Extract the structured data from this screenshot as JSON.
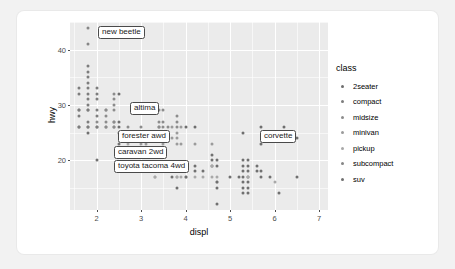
{
  "chart_data": {
    "type": "scatter",
    "title": "",
    "xlabel": "displ",
    "ylabel": "hwy",
    "xlim": [
      1.4,
      7.2
    ],
    "ylim": [
      11,
      45
    ],
    "xticks": [
      2,
      3,
      4,
      5,
      6,
      7
    ],
    "yticks": [
      20,
      30,
      40
    ],
    "grid": true,
    "legend": {
      "title": "class",
      "position": "right",
      "entries": [
        {
          "label": "2seater",
          "color": "#6e6e6e"
        },
        {
          "label": "compact",
          "color": "#7d7d7d"
        },
        {
          "label": "midsize",
          "color": "#8c8c8c"
        },
        {
          "label": "minivan",
          "color": "#9b9b9b"
        },
        {
          "label": "pickup",
          "color": "#a8a8a8"
        },
        {
          "label": "subcompact",
          "color": "#868686"
        },
        {
          "label": "suv",
          "color": "#707070"
        }
      ]
    },
    "annotations": [
      {
        "text": "new beetle",
        "x": 2.0,
        "y": 44,
        "box_x": 28,
        "box_y": 4
      },
      {
        "text": "altima",
        "x": 2.5,
        "y": 32,
        "box_x": 60,
        "box_y": 80
      },
      {
        "text": "forester awd",
        "x": 2.5,
        "y": 27,
        "box_x": 48,
        "box_y": 108
      },
      {
        "text": "caravan 2wd",
        "x": 3.3,
        "y": 24,
        "box_x": 44,
        "box_y": 124
      },
      {
        "text": "toyota tacoma 4wd",
        "x": 2.7,
        "y": 22,
        "box_x": 44,
        "box_y": 138
      },
      {
        "text": "corvette",
        "x": 5.7,
        "y": 26,
        "box_x": 190,
        "box_y": 108
      }
    ],
    "points": [
      {
        "x": 1.6,
        "y": 33,
        "c": 1
      },
      {
        "x": 1.6,
        "y": 32,
        "c": 1
      },
      {
        "x": 1.6,
        "y": 29,
        "c": 1
      },
      {
        "x": 1.6,
        "y": 29,
        "c": 1
      },
      {
        "x": 1.6,
        "y": 28,
        "c": 1
      },
      {
        "x": 1.6,
        "y": 26,
        "c": 1
      },
      {
        "x": 1.6,
        "y": 26,
        "c": 1
      },
      {
        "x": 1.8,
        "y": 44,
        "c": 5
      },
      {
        "x": 1.8,
        "y": 41,
        "c": 5
      },
      {
        "x": 1.8,
        "y": 37,
        "c": 1
      },
      {
        "x": 1.8,
        "y": 36,
        "c": 1
      },
      {
        "x": 1.8,
        "y": 35,
        "c": 1
      },
      {
        "x": 1.8,
        "y": 34,
        "c": 1
      },
      {
        "x": 1.8,
        "y": 33,
        "c": 1
      },
      {
        "x": 1.8,
        "y": 32,
        "c": 1
      },
      {
        "x": 1.8,
        "y": 31,
        "c": 1
      },
      {
        "x": 1.8,
        "y": 30,
        "c": 1
      },
      {
        "x": 1.8,
        "y": 29,
        "c": 1
      },
      {
        "x": 1.8,
        "y": 29,
        "c": 1
      },
      {
        "x": 1.8,
        "y": 27,
        "c": 1
      },
      {
        "x": 1.8,
        "y": 26,
        "c": 1
      },
      {
        "x": 1.8,
        "y": 26,
        "c": 1
      },
      {
        "x": 1.8,
        "y": 25,
        "c": 6
      },
      {
        "x": 2.0,
        "y": 33,
        "c": 1
      },
      {
        "x": 2.0,
        "y": 32,
        "c": 1
      },
      {
        "x": 2.0,
        "y": 31,
        "c": 1
      },
      {
        "x": 2.0,
        "y": 29,
        "c": 1
      },
      {
        "x": 2.0,
        "y": 28,
        "c": 1
      },
      {
        "x": 2.0,
        "y": 27,
        "c": 2
      },
      {
        "x": 2.0,
        "y": 26,
        "c": 1
      },
      {
        "x": 2.0,
        "y": 26,
        "c": 1
      },
      {
        "x": 2.0,
        "y": 20,
        "c": 6
      },
      {
        "x": 2.2,
        "y": 29,
        "c": 2
      },
      {
        "x": 2.2,
        "y": 29,
        "c": 2
      },
      {
        "x": 2.2,
        "y": 28,
        "c": 2
      },
      {
        "x": 2.2,
        "y": 27,
        "c": 2
      },
      {
        "x": 2.2,
        "y": 26,
        "c": 2
      },
      {
        "x": 2.2,
        "y": 26,
        "c": 2
      },
      {
        "x": 2.4,
        "y": 32,
        "c": 2
      },
      {
        "x": 2.4,
        "y": 31,
        "c": 2
      },
      {
        "x": 2.4,
        "y": 30,
        "c": 2
      },
      {
        "x": 2.4,
        "y": 29,
        "c": 2
      },
      {
        "x": 2.4,
        "y": 27,
        "c": 2
      },
      {
        "x": 2.4,
        "y": 27,
        "c": 2
      },
      {
        "x": 2.4,
        "y": 26,
        "c": 2
      },
      {
        "x": 2.4,
        "y": 26,
        "c": 2
      },
      {
        "x": 2.5,
        "y": 32,
        "c": 6
      },
      {
        "x": 2.5,
        "y": 27,
        "c": 6
      },
      {
        "x": 2.5,
        "y": 26,
        "c": 6
      },
      {
        "x": 2.5,
        "y": 25,
        "c": 6
      },
      {
        "x": 2.5,
        "y": 23,
        "c": 6
      },
      {
        "x": 2.5,
        "y": 22,
        "c": 6
      },
      {
        "x": 2.7,
        "y": 26,
        "c": 2
      },
      {
        "x": 2.7,
        "y": 25,
        "c": 2
      },
      {
        "x": 2.7,
        "y": 24,
        "c": 2
      },
      {
        "x": 2.7,
        "y": 23,
        "c": 4
      },
      {
        "x": 2.7,
        "y": 22,
        "c": 4
      },
      {
        "x": 2.7,
        "y": 22,
        "c": 4
      },
      {
        "x": 2.8,
        "y": 24,
        "c": 3
      },
      {
        "x": 2.8,
        "y": 24,
        "c": 3
      },
      {
        "x": 3.0,
        "y": 26,
        "c": 2
      },
      {
        "x": 3.0,
        "y": 25,
        "c": 2
      },
      {
        "x": 3.0,
        "y": 24,
        "c": 3
      },
      {
        "x": 3.0,
        "y": 23,
        "c": 3
      },
      {
        "x": 3.1,
        "y": 23,
        "c": 3
      },
      {
        "x": 3.1,
        "y": 22,
        "c": 3
      },
      {
        "x": 3.3,
        "y": 22,
        "c": 3
      },
      {
        "x": 3.3,
        "y": 18,
        "c": 4
      },
      {
        "x": 3.3,
        "y": 17,
        "c": 4
      },
      {
        "x": 3.3,
        "y": 17,
        "c": 4
      },
      {
        "x": 3.4,
        "y": 29,
        "c": 2
      },
      {
        "x": 3.4,
        "y": 27,
        "c": 2
      },
      {
        "x": 3.4,
        "y": 26,
        "c": 2
      },
      {
        "x": 3.4,
        "y": 26,
        "c": 2
      },
      {
        "x": 3.4,
        "y": 24,
        "c": 3
      },
      {
        "x": 3.4,
        "y": 22,
        "c": 6
      },
      {
        "x": 3.5,
        "y": 29,
        "c": 2
      },
      {
        "x": 3.5,
        "y": 27,
        "c": 2
      },
      {
        "x": 3.5,
        "y": 26,
        "c": 2
      },
      {
        "x": 3.5,
        "y": 25,
        "c": 3
      },
      {
        "x": 3.5,
        "y": 23,
        "c": 3
      },
      {
        "x": 3.5,
        "y": 19,
        "c": 6
      },
      {
        "x": 3.5,
        "y": 18,
        "c": 6
      },
      {
        "x": 3.5,
        "y": 18,
        "c": 6
      },
      {
        "x": 3.6,
        "y": 26,
        "c": 2
      },
      {
        "x": 3.6,
        "y": 24,
        "c": 3
      },
      {
        "x": 3.6,
        "y": 19,
        "c": 6
      },
      {
        "x": 3.6,
        "y": 18,
        "c": 6
      },
      {
        "x": 3.7,
        "y": 26,
        "c": 3
      },
      {
        "x": 3.7,
        "y": 24,
        "c": 3
      },
      {
        "x": 3.7,
        "y": 18,
        "c": 6
      },
      {
        "x": 3.7,
        "y": 17,
        "c": 6
      },
      {
        "x": 3.8,
        "y": 28,
        "c": 2
      },
      {
        "x": 3.8,
        "y": 27,
        "c": 2
      },
      {
        "x": 3.8,
        "y": 26,
        "c": 2
      },
      {
        "x": 3.8,
        "y": 25,
        "c": 3
      },
      {
        "x": 3.8,
        "y": 24,
        "c": 3
      },
      {
        "x": 3.8,
        "y": 23,
        "c": 3
      },
      {
        "x": 3.8,
        "y": 19,
        "c": 6
      },
      {
        "x": 3.8,
        "y": 18,
        "c": 6
      },
      {
        "x": 3.8,
        "y": 17,
        "c": 4
      },
      {
        "x": 3.8,
        "y": 17,
        "c": 4
      },
      {
        "x": 3.8,
        "y": 15,
        "c": 6
      },
      {
        "x": 3.9,
        "y": 26,
        "c": 3
      },
      {
        "x": 3.9,
        "y": 23,
        "c": 3
      },
      {
        "x": 3.9,
        "y": 19,
        "c": 6
      },
      {
        "x": 3.9,
        "y": 17,
        "c": 4
      },
      {
        "x": 4.0,
        "y": 26,
        "c": 0
      },
      {
        "x": 4.0,
        "y": 19,
        "c": 6
      },
      {
        "x": 4.0,
        "y": 17,
        "c": 4
      },
      {
        "x": 4.0,
        "y": 17,
        "c": 6
      },
      {
        "x": 4.2,
        "y": 26,
        "c": 0
      },
      {
        "x": 4.2,
        "y": 23,
        "c": 3
      },
      {
        "x": 4.2,
        "y": 19,
        "c": 6
      },
      {
        "x": 4.2,
        "y": 18,
        "c": 6
      },
      {
        "x": 4.2,
        "y": 17,
        "c": 4
      },
      {
        "x": 4.4,
        "y": 18,
        "c": 6
      },
      {
        "x": 4.4,
        "y": 17,
        "c": 4
      },
      {
        "x": 4.6,
        "y": 23,
        "c": 3
      },
      {
        "x": 4.6,
        "y": 21,
        "c": 6
      },
      {
        "x": 4.6,
        "y": 20,
        "c": 6
      },
      {
        "x": 4.6,
        "y": 19,
        "c": 6
      },
      {
        "x": 4.6,
        "y": 19,
        "c": 4
      },
      {
        "x": 4.6,
        "y": 17,
        "c": 4
      },
      {
        "x": 4.7,
        "y": 20,
        "c": 6
      },
      {
        "x": 4.7,
        "y": 19,
        "c": 6
      },
      {
        "x": 4.7,
        "y": 17,
        "c": 4
      },
      {
        "x": 4.7,
        "y": 16,
        "c": 4
      },
      {
        "x": 4.7,
        "y": 16,
        "c": 6
      },
      {
        "x": 4.7,
        "y": 15,
        "c": 6
      },
      {
        "x": 4.7,
        "y": 12,
        "c": 6
      },
      {
        "x": 5.0,
        "y": 17,
        "c": 6
      },
      {
        "x": 5.2,
        "y": 17,
        "c": 6
      },
      {
        "x": 5.3,
        "y": 25,
        "c": 0
      },
      {
        "x": 5.3,
        "y": 20,
        "c": 6
      },
      {
        "x": 5.3,
        "y": 19,
        "c": 6
      },
      {
        "x": 5.3,
        "y": 18,
        "c": 6
      },
      {
        "x": 5.3,
        "y": 17,
        "c": 6
      },
      {
        "x": 5.3,
        "y": 16,
        "c": 6
      },
      {
        "x": 5.3,
        "y": 15,
        "c": 6
      },
      {
        "x": 5.3,
        "y": 14,
        "c": 6
      },
      {
        "x": 5.4,
        "y": 20,
        "c": 6
      },
      {
        "x": 5.4,
        "y": 19,
        "c": 6
      },
      {
        "x": 5.4,
        "y": 18,
        "c": 6
      },
      {
        "x": 5.4,
        "y": 17,
        "c": 6
      },
      {
        "x": 5.4,
        "y": 17,
        "c": 4
      },
      {
        "x": 5.4,
        "y": 16,
        "c": 6
      },
      {
        "x": 5.4,
        "y": 15,
        "c": 6
      },
      {
        "x": 5.4,
        "y": 14,
        "c": 6
      },
      {
        "x": 5.6,
        "y": 19,
        "c": 6
      },
      {
        "x": 5.6,
        "y": 18,
        "c": 6
      },
      {
        "x": 5.7,
        "y": 26,
        "c": 0
      },
      {
        "x": 5.7,
        "y": 23,
        "c": 6
      },
      {
        "x": 5.7,
        "y": 18,
        "c": 6
      },
      {
        "x": 5.7,
        "y": 17,
        "c": 6
      },
      {
        "x": 5.9,
        "y": 17,
        "c": 6
      },
      {
        "x": 6.0,
        "y": 16,
        "c": 4
      },
      {
        "x": 6.1,
        "y": 14,
        "c": 6
      },
      {
        "x": 6.2,
        "y": 26,
        "c": 0
      },
      {
        "x": 6.2,
        "y": 25,
        "c": 0
      },
      {
        "x": 6.5,
        "y": 24,
        "c": 0
      },
      {
        "x": 6.5,
        "y": 17,
        "c": 6
      }
    ]
  }
}
